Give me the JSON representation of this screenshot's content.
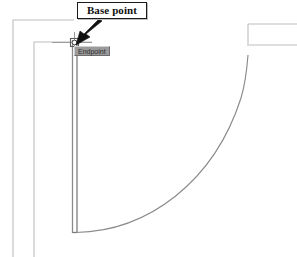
{
  "drawing": {
    "title": "Door plan with swing arc",
    "application_hint": "cad-floor-plan",
    "background_color": "#ffffff",
    "line_color_wall": "#b9b9b9",
    "line_color_door": "#6f6f6f",
    "line_color_arc": "#7a7a7a",
    "callout": {
      "label": "Base point",
      "text_color": "#111111",
      "border_color": "#1a1a1a",
      "fill_color": "#ffffff",
      "arrow_color": "#000000"
    },
    "osnap": {
      "tooltip_label": "Endpoint",
      "tooltip_fill": "#9a9a9a",
      "tooltip_text_color": "#2b2b2b",
      "marker_name": "endpoint-snap-marker",
      "marker_color": "#4a4a4a"
    },
    "elements": [
      {
        "name": "outer-wall-left-vertical",
        "type": "line"
      },
      {
        "name": "outer-wall-top-horizontal",
        "type": "line"
      },
      {
        "name": "inner-wall-left-vertical",
        "type": "line"
      },
      {
        "name": "inner-wall-top-horizontal",
        "type": "line"
      },
      {
        "name": "door-leaf-line-outer",
        "type": "line"
      },
      {
        "name": "door-leaf-line-inner",
        "type": "line"
      },
      {
        "name": "door-swing-arc",
        "type": "arc"
      },
      {
        "name": "right-wall-vertical",
        "type": "line"
      },
      {
        "name": "right-wall-top-horizontal",
        "type": "line"
      },
      {
        "name": "right-wall-inner-horizontal",
        "type": "line"
      },
      {
        "name": "base-point-crosshair",
        "type": "marker"
      }
    ]
  }
}
